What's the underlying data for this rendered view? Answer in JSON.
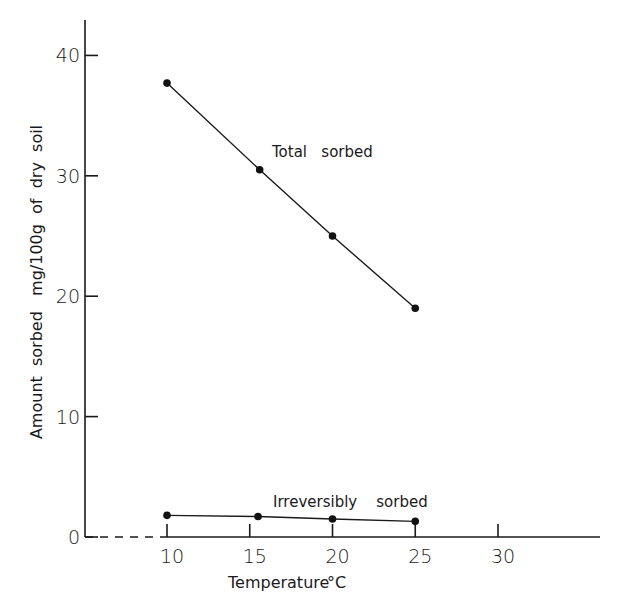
{
  "chart_data": {
    "type": "line",
    "title": "",
    "xlabel": "Temperature °C",
    "ylabel": "Amount sorbed mg/100g of dry soil",
    "xlim": [
      5,
      35
    ],
    "ylim": [
      0,
      42
    ],
    "x_ticks": [
      10,
      15,
      20,
      25,
      30
    ],
    "y_ticks": [
      0,
      10,
      20,
      30,
      40
    ],
    "x_tick_labels": [
      "10",
      "15",
      "20",
      "25",
      "30"
    ],
    "y_tick_labels": [
      "0",
      "10",
      "20",
      "30",
      "40"
    ],
    "grid": false,
    "legend": "none (inline series labels)",
    "series": [
      {
        "name": "Total sorbed",
        "x": [
          10,
          15.6,
          20,
          25
        ],
        "values": [
          37.7,
          30.5,
          25.0,
          19.0
        ]
      },
      {
        "name": "Irreversibly sorbed",
        "x": [
          10,
          15.5,
          20,
          25
        ],
        "values": [
          1.8,
          1.7,
          1.5,
          1.3
        ]
      }
    ],
    "annotations": [
      {
        "text": "Total sorbed",
        "near_series": "Total sorbed"
      },
      {
        "text": "Irreversibly sorbed",
        "near_series": "Irreversibly sorbed"
      }
    ],
    "x_axis_broken_segment": {
      "from": 5,
      "to": 10,
      "style": "dashed"
    }
  },
  "labels": {
    "xlabel": "Temperature",
    "xlabel_unit": "°C",
    "ylabel": "Amount  sorbed   mg/100g  of  dry  soil",
    "total": "Total   sorbed",
    "irreversible": "Irreversibly    sorbed"
  }
}
